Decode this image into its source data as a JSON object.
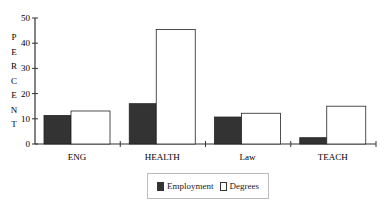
{
  "chart_data": {
    "type": "bar",
    "title": "",
    "xlabel": "",
    "ylabel": "PERCENT",
    "ylim": [
      0,
      50
    ],
    "yticks": [
      0,
      10,
      20,
      30,
      40,
      50
    ],
    "grid": false,
    "legend_position": "bottom",
    "categories": [
      "ENG",
      "HEALTH",
      "Law",
      "TEACH"
    ],
    "series": [
      {
        "name": "Employment",
        "color": "#333333",
        "values": [
          11.3,
          16.0,
          10.7,
          2.5
        ]
      },
      {
        "name": "Degrees",
        "color": "#ffffff",
        "values": [
          13.1,
          45.4,
          12.2,
          15.0
        ]
      }
    ]
  },
  "legend": {
    "items": [
      {
        "label": "Employment",
        "color": "#333333"
      },
      {
        "label": "Degrees",
        "color": "#ffffff"
      }
    ]
  }
}
